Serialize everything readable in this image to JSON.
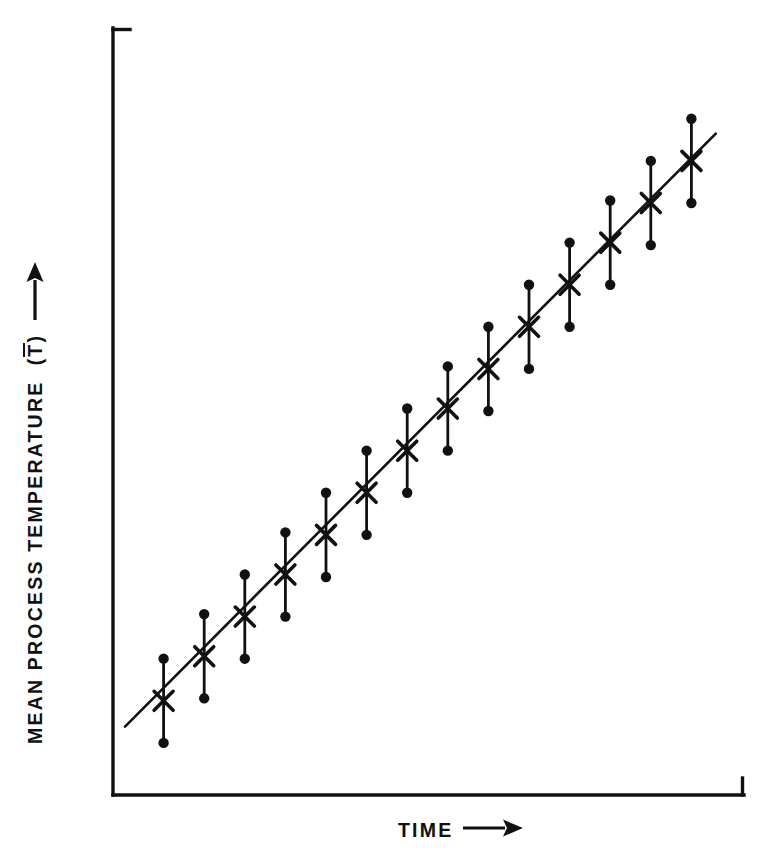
{
  "chart_data": {
    "type": "line",
    "title": "",
    "subtitle": "",
    "xlabel": "TIME",
    "ylabel": "MEAN  PROCESS  TEMPERATURE",
    "ylabel_symbol": "T",
    "ylabel_symbol_open": "(",
    "ylabel_symbol_close": ")",
    "xlabel_arrow": "arrow-right",
    "ylabel_arrow": "arrow-up",
    "grid": false,
    "legend": "none",
    "axis_ticks_labeled": false,
    "xlim": [
      0,
      15
    ],
    "ylim": [
      0,
      15
    ],
    "series": [
      {
        "name": "Mean process temperature",
        "marker": "x",
        "errorbar_cap": "filled-circle",
        "trendline": true,
        "x": [
          1,
          2,
          3,
          4,
          5,
          6,
          7,
          8,
          9,
          10,
          11,
          12,
          13,
          14
        ],
        "y": [
          1.7,
          2.6,
          3.4,
          4.25,
          5.05,
          5.9,
          6.75,
          7.6,
          8.4,
          9.25,
          10.1,
          10.95,
          11.75,
          12.6
        ],
        "yerr": [
          0.85,
          0.85,
          0.85,
          0.85,
          0.85,
          0.85,
          0.85,
          0.85,
          0.85,
          0.85,
          0.85,
          0.85,
          0.85,
          0.85
        ]
      }
    ],
    "trendline": {
      "x_start": 0.05,
      "y_start": 1.18,
      "x_end": 14.6,
      "y_end": 13.15
    },
    "colors": {
      "axis": "#111111",
      "line": "#111111",
      "marker": "#111111",
      "errorbar": "#111111",
      "background": "#ffffff"
    }
  },
  "figure": {
    "axis_origin_x": 113,
    "axis_origin_y": 795,
    "axis_top_y": 28,
    "axis_right_x": 744,
    "axis_top_tick_length": 16,
    "axis_right_tick_length": 16
  }
}
